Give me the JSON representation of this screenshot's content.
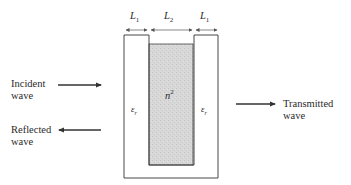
{
  "diagram": {
    "dimensions": {
      "left": {
        "symbol": "L",
        "subscript": "1"
      },
      "middle": {
        "symbol": "L",
        "subscript": "2"
      },
      "right": {
        "symbol": "L",
        "subscript": "1"
      }
    },
    "regions": {
      "left_slab": {
        "symbol": "ε",
        "subscript": "r"
      },
      "center": {
        "symbol": "n",
        "superscript": "2"
      },
      "right_slab": {
        "symbol": "ε",
        "subscript": "r"
      }
    },
    "waves": {
      "incident": {
        "line1": "Incident",
        "line2": "wave"
      },
      "reflected": {
        "line1": "Reflected",
        "line2": "wave"
      },
      "transmitted": {
        "line1": "Transmitted",
        "line2": "wave"
      }
    },
    "colors": {
      "stroke": "#333333",
      "shading": "#d6d6d6"
    }
  }
}
